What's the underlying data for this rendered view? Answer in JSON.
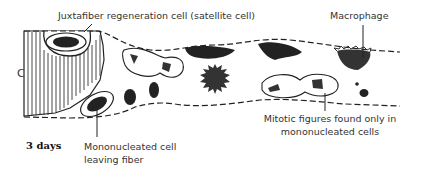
{
  "diagram": {
    "stage_label": "3 days",
    "region_label": "C",
    "labels": {
      "satellite": "Juxtafiber regeneration cell (satellite cell)",
      "macrophage": "Macrophage",
      "mononucleated_line1": "Mononucleated cell",
      "mononucleated_line2": "leaving fiber",
      "mitotic_line1": "Mitotic figures found only in",
      "mitotic_line2": "mononucleated cells"
    }
  }
}
